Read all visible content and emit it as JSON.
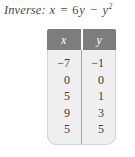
{
  "caption": {
    "label": "Inverse:",
    "lhs": "x",
    "equals": "=",
    "coefficient": "6",
    "term1_var": "y",
    "minus": "−",
    "term2_var": "y",
    "term2_exp": "2",
    "full_text": "Inverse: x = 6y − y²"
  },
  "table": {
    "headers": [
      "x",
      "y"
    ],
    "rows": [
      [
        "−7",
        "−1"
      ],
      [
        "0",
        "0"
      ],
      [
        "5",
        "1"
      ],
      [
        "9",
        "3"
      ],
      [
        "5",
        "5"
      ]
    ],
    "columns": {
      "x": [
        "−7",
        "0",
        "5",
        "9",
        "5"
      ],
      "y": [
        "−1",
        "0",
        "1",
        "3",
        "5"
      ]
    }
  },
  "colors": {
    "header_bg": "#7d7d7d",
    "header_text": "#ffffff",
    "body_bg": "#efefef",
    "body_text": "#3c3c3c",
    "divider": "#a9a9a9",
    "page_bg": "#ffffff",
    "caption_text": "#4a4a4a"
  }
}
